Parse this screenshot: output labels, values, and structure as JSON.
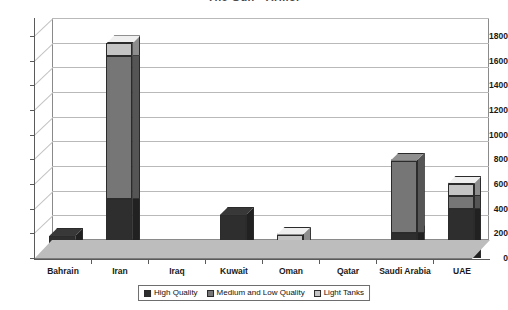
{
  "chart_data": {
    "type": "bar",
    "subtype": "stacked-3d-column",
    "title": "The Gulf - Armor",
    "xlabel": "",
    "ylabel": "",
    "ylim": [
      0,
      1800
    ],
    "ytick_step": 200,
    "yticks": [
      0,
      200,
      400,
      600,
      800,
      1000,
      1200,
      1400,
      1600,
      1800
    ],
    "ytick_labels": [
      "0",
      "200",
      "400",
      "600",
      "800",
      "1000",
      "1200",
      "1400",
      "1600",
      "1800"
    ],
    "grid": true,
    "grid_axis": "y",
    "legend_position": "bottom",
    "categories": [
      "Bahrain",
      "Iran",
      "Iraq",
      "Kuwait",
      "Oman",
      "Qatar",
      "Saudi Arabia",
      "UAE"
    ],
    "series": [
      {
        "name": "High Quality",
        "color": "#2e2e2e",
        "values": [
          180,
          480,
          0,
          350,
          80,
          45,
          200,
          400
        ]
      },
      {
        "name": "Medium and Low Quality",
        "color": "#767676",
        "values": [
          0,
          1160,
          0,
          0,
          60,
          0,
          590,
          100
        ]
      },
      {
        "name": "Light Tanks",
        "color": "#c4c4c4",
        "values": [
          0,
          100,
          0,
          0,
          50,
          0,
          0,
          100
        ]
      }
    ],
    "totals": [
      180,
      1740,
      0,
      350,
      190,
      45,
      790,
      600
    ]
  },
  "legend": {
    "items": [
      {
        "label": "High Quality",
        "color": "#2e2e2e"
      },
      {
        "label": "Medium and Low Quality",
        "color": "#767676"
      },
      {
        "label": "Light Tanks",
        "color": "#c4c4c4"
      }
    ]
  },
  "colors": {
    "high_quality": "#2e2e2e",
    "medium_low_quality": "#767676",
    "light_tanks": "#c4c4c4",
    "floor": "#bdbdbd",
    "gridline": "#b9b9b9",
    "axis": "#5a5a5a",
    "plot_border": "#8a8a8a",
    "background": "#ffffff"
  }
}
